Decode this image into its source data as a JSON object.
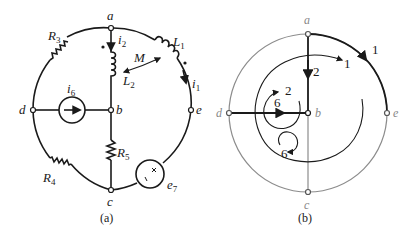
{
  "figure_a": {
    "caption": "(a)",
    "nodes": {
      "a": "a",
      "b": "b",
      "c": "c",
      "d": "d",
      "e": "e"
    },
    "elements": {
      "R3": {
        "main": "R",
        "sub": "3"
      },
      "R4": {
        "main": "R",
        "sub": "4"
      },
      "R5": {
        "main": "R",
        "sub": "5"
      },
      "L1": {
        "main": "L",
        "sub": "1"
      },
      "L2": {
        "main": "L",
        "sub": "2"
      },
      "M": "M",
      "i1": {
        "main": "i",
        "sub": "1"
      },
      "i2": {
        "main": "i",
        "sub": "2"
      },
      "i6": {
        "main": "i",
        "sub": "6"
      },
      "e7": {
        "main": "e",
        "sub": "7"
      }
    },
    "source_signs": {
      "plus": "+",
      "minus": "−"
    }
  },
  "figure_b": {
    "caption": "(b)",
    "nodes": {
      "a": "a",
      "b": "b",
      "c": "c",
      "d": "d",
      "e": "e"
    },
    "branch_labels": {
      "outer_1": "1",
      "inner_1": "1",
      "branch_2": "2",
      "loop_2": "2",
      "branch_6": "6",
      "loop_6": "6"
    },
    "colors": {
      "tree": "#1a1a1a",
      "cotree": "#8c8c8c"
    }
  }
}
